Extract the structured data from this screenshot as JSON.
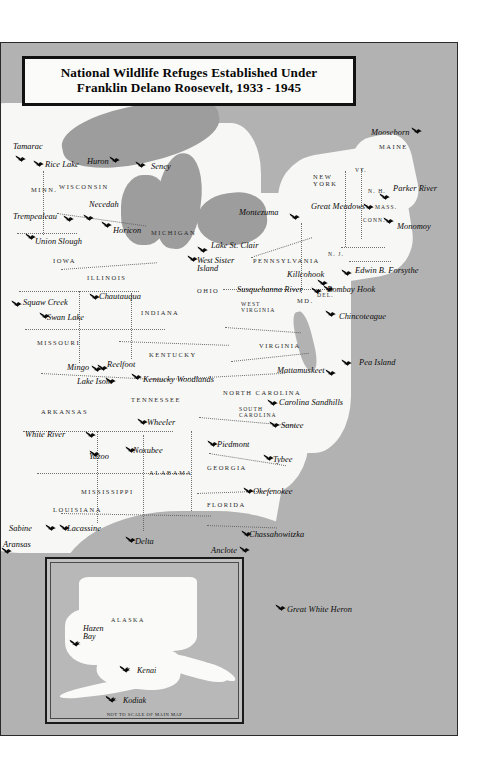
{
  "title": {
    "line1": "National Wildlife Refuges Established Under",
    "line2": "Franklin Delano Roosevelt, 1933 - 1945"
  },
  "inset": {
    "region_label": "ALASKA",
    "caption": "NOT TO SCALE OF MAIN MAP",
    "refuges": [
      {
        "name": "Hazen\nBay",
        "x": 32,
        "y": 62,
        "bx": 18,
        "by": 74
      },
      {
        "name": "Kenai",
        "x": 86,
        "y": 104,
        "bx": 68,
        "by": 100
      },
      {
        "name": "Kodiak",
        "x": 72,
        "y": 134,
        "bx": 54,
        "by": 130
      }
    ]
  },
  "states": [
    {
      "label": "MINN.",
      "x": 30,
      "y": 185,
      "size": "n"
    },
    {
      "label": "WISCONSIN",
      "x": 58,
      "y": 182,
      "size": "n"
    },
    {
      "label": "MICHIGAN",
      "x": 150,
      "y": 228,
      "size": "n"
    },
    {
      "label": "IOWA",
      "x": 52,
      "y": 256,
      "size": "n"
    },
    {
      "label": "ILLINOIS",
      "x": 86,
      "y": 273,
      "size": "n"
    },
    {
      "label": "INDIANA",
      "x": 140,
      "y": 308,
      "size": "n"
    },
    {
      "label": "OHIO",
      "x": 196,
      "y": 286,
      "size": "n"
    },
    {
      "label": "MISSOURI",
      "x": 36,
      "y": 338,
      "size": "n"
    },
    {
      "label": "ARKANSAS",
      "x": 40,
      "y": 407,
      "size": "n"
    },
    {
      "label": "KENTUCKY",
      "x": 148,
      "y": 350,
      "size": "n"
    },
    {
      "label": "TENNESSEE",
      "x": 130,
      "y": 395,
      "size": "n"
    },
    {
      "label": "MISSISSIPPI",
      "x": 80,
      "y": 487,
      "size": "n"
    },
    {
      "label": "LOUISIANA",
      "x": 52,
      "y": 505,
      "size": "n"
    },
    {
      "label": "ALABAMA",
      "x": 148,
      "y": 468,
      "size": "n"
    },
    {
      "label": "GEORGIA",
      "x": 206,
      "y": 463,
      "size": "n"
    },
    {
      "label": "FLORIDA",
      "x": 206,
      "y": 500,
      "size": "n"
    },
    {
      "label": "SOUTH\nCAROLINA",
      "x": 238,
      "y": 405,
      "size": "s"
    },
    {
      "label": "NORTH CAROLINA",
      "x": 222,
      "y": 388,
      "size": "n"
    },
    {
      "label": "VIRGINIA",
      "x": 258,
      "y": 341,
      "size": "n"
    },
    {
      "label": "WEST\nVIRGINIA",
      "x": 240,
      "y": 300,
      "size": "s"
    },
    {
      "label": "PENNSYLVANIA",
      "x": 252,
      "y": 256,
      "size": "n"
    },
    {
      "label": "NEW\nYORK",
      "x": 312,
      "y": 172,
      "size": "n"
    },
    {
      "label": "MAINE",
      "x": 378,
      "y": 142,
      "size": "n"
    },
    {
      "label": "MD.",
      "x": 296,
      "y": 296,
      "size": "n"
    },
    {
      "label": "DEL.",
      "x": 316,
      "y": 291,
      "size": "s"
    },
    {
      "label": "N. J.",
      "x": 327,
      "y": 250,
      "size": "s"
    },
    {
      "label": "N. H.",
      "x": 367,
      "y": 187,
      "size": "s"
    },
    {
      "label": "MASS.",
      "x": 374,
      "y": 203,
      "size": "s"
    },
    {
      "label": "CONN.",
      "x": 362,
      "y": 216,
      "size": "s"
    },
    {
      "label": "VT.",
      "x": 354,
      "y": 166,
      "size": "s"
    }
  ],
  "refuges": [
    {
      "name": "Tamarac",
      "lx": 12,
      "ly": 142,
      "bx": 14,
      "by": 152
    },
    {
      "name": "Rice Lake",
      "lx": 44,
      "ly": 160,
      "bx": 32,
      "by": 157
    },
    {
      "name": "Huron",
      "lx": 86,
      "ly": 157,
      "bx": 108,
      "by": 153
    },
    {
      "name": "Seney",
      "lx": 150,
      "ly": 162,
      "bx": 134,
      "by": 158
    },
    {
      "name": "Trempealeau",
      "lx": 12,
      "ly": 212,
      "bx": 62,
      "by": 212
    },
    {
      "name": "Necedah",
      "lx": 88,
      "ly": 200,
      "bx": 82,
      "by": 211
    },
    {
      "name": "Horicon",
      "lx": 112,
      "ly": 226,
      "bx": 100,
      "by": 218
    },
    {
      "name": "Union Slough",
      "lx": 34,
      "ly": 237,
      "bx": 24,
      "by": 230
    },
    {
      "name": "Lake St. Clair",
      "lx": 210,
      "ly": 241,
      "bx": 196,
      "by": 243
    },
    {
      "name": "West Sister\nIsland",
      "lx": 196,
      "ly": 256,
      "bx": 186,
      "by": 252
    },
    {
      "name": "Montezuma",
      "lx": 238,
      "ly": 208,
      "bx": 288,
      "by": 210
    },
    {
      "name": "Great Meadows",
      "lx": 310,
      "ly": 202,
      "bx": 362,
      "by": 200
    },
    {
      "name": "Mooseborn",
      "lx": 370,
      "ly": 128,
      "bx": 410,
      "by": 124
    },
    {
      "name": "Parker River",
      "lx": 392,
      "ly": 184,
      "bx": 378,
      "by": 190
    },
    {
      "name": "Monomoy",
      "lx": 396,
      "ly": 222,
      "bx": 382,
      "by": 214
    },
    {
      "name": "Killcohook",
      "lx": 286,
      "ly": 270,
      "bx": 316,
      "by": 276
    },
    {
      "name": "Susquehanna River",
      "lx": 236,
      "ly": 285,
      "bx": 310,
      "by": 284
    },
    {
      "name": "Edwin B. Forsythe",
      "lx": 354,
      "ly": 266,
      "bx": 340,
      "by": 266
    },
    {
      "name": "Bombay Hook",
      "lx": 326,
      "ly": 285,
      "bx": 322,
      "by": 282
    },
    {
      "name": "Chincoteague",
      "lx": 338,
      "ly": 312,
      "bx": 324,
      "by": 307
    },
    {
      "name": "Squaw Creek",
      "lx": 22,
      "ly": 298,
      "bx": 10,
      "by": 297
    },
    {
      "name": "Chautauqua",
      "lx": 98,
      "ly": 292,
      "bx": 88,
      "by": 290
    },
    {
      "name": "Swan Lake",
      "lx": 46,
      "ly": 313,
      "bx": 38,
      "by": 309
    },
    {
      "name": "Mingo",
      "lx": 66,
      "ly": 363,
      "bx": 90,
      "by": 362
    },
    {
      "name": "Reelfoot",
      "lx": 106,
      "ly": 360,
      "bx": 96,
      "by": 361
    },
    {
      "name": "Lake Isom",
      "lx": 76,
      "ly": 377,
      "bx": 104,
      "by": 374
    },
    {
      "name": "Kentucky Woodlands",
      "lx": 142,
      "ly": 375,
      "bx": 130,
      "by": 370
    },
    {
      "name": "Mattamuskeet",
      "lx": 276,
      "ly": 366,
      "bx": 324,
      "by": 366
    },
    {
      "name": "Pea Island",
      "lx": 358,
      "ly": 358,
      "bx": 340,
      "by": 356
    },
    {
      "name": "Carolina Sandhills",
      "lx": 278,
      "ly": 398,
      "bx": 266,
      "by": 396
    },
    {
      "name": "Santee",
      "lx": 280,
      "ly": 421,
      "bx": 268,
      "by": 418
    },
    {
      "name": "Wheeler",
      "lx": 146,
      "ly": 418,
      "bx": 136,
      "by": 415
    },
    {
      "name": "Piedmont",
      "lx": 216,
      "ly": 440,
      "bx": 206,
      "by": 437
    },
    {
      "name": "Tybee",
      "lx": 272,
      "ly": 455,
      "bx": 262,
      "by": 451
    },
    {
      "name": "White River",
      "lx": 24,
      "ly": 430,
      "bx": 84,
      "by": 428
    },
    {
      "name": "Yazoo",
      "lx": 88,
      "ly": 452,
      "bx": 88,
      "by": 447
    },
    {
      "name": "Noxubee",
      "lx": 132,
      "ly": 446,
      "bx": 124,
      "by": 443
    },
    {
      "name": "Okefenokee",
      "lx": 252,
      "ly": 487,
      "bx": 242,
      "by": 484
    },
    {
      "name": "Sabine",
      "lx": 8,
      "ly": 524,
      "bx": 44,
      "by": 521
    },
    {
      "name": "Lacassine",
      "lx": 66,
      "ly": 524,
      "bx": 58,
      "by": 521
    },
    {
      "name": "Delta",
      "lx": 134,
      "ly": 537,
      "bx": 124,
      "by": 533
    },
    {
      "name": "Aransas",
      "lx": 2,
      "ly": 540,
      "bx": 0,
      "by": 544
    },
    {
      "name": "Chassahowitzka",
      "lx": 248,
      "ly": 530,
      "bx": 240,
      "by": 527
    },
    {
      "name": "Anclote",
      "lx": 210,
      "ly": 546,
      "bx": 238,
      "by": 543
    },
    {
      "name": "Great White Heron",
      "lx": 286,
      "ly": 605,
      "bx": 274,
      "by": 601
    }
  ]
}
